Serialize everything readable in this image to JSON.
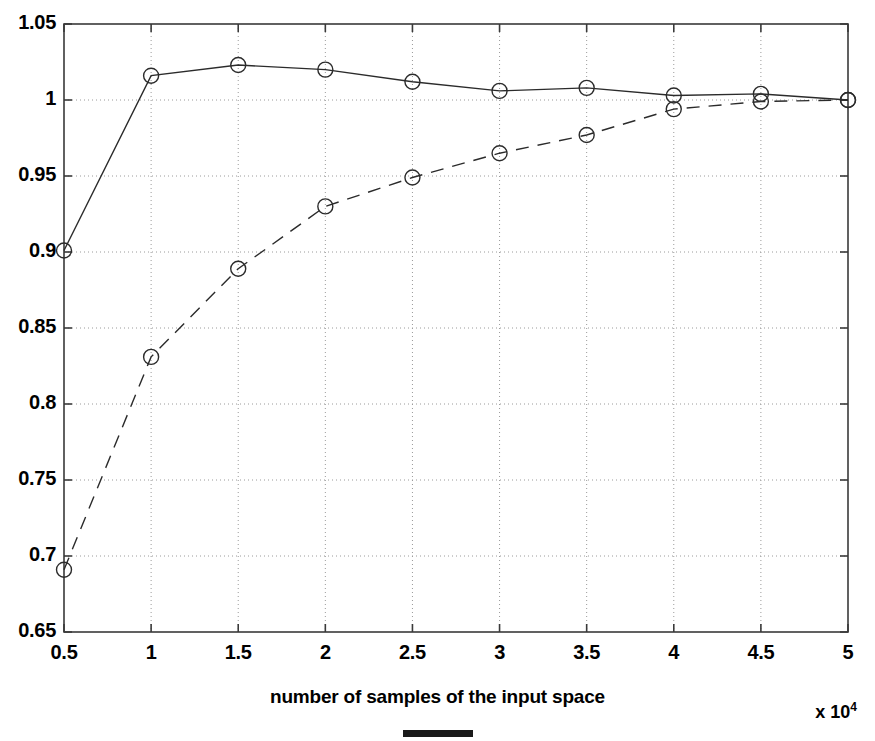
{
  "chart_data": {
    "type": "line",
    "title": "",
    "xlabel": "number of samples of the input space",
    "ylabel": "",
    "x_multiplier": "x 10",
    "x_multiplier_exp": "4",
    "xlim": [
      0.5,
      5
    ],
    "ylim": [
      0.65,
      1.05
    ],
    "grid": true,
    "legend": "none",
    "xticks": [
      "0.5",
      "1",
      "1.5",
      "2",
      "2.5",
      "3",
      "3.5",
      "4",
      "4.5",
      "5"
    ],
    "xtick_values": [
      0.5,
      1,
      1.5,
      2,
      2.5,
      3,
      3.5,
      4,
      4.5,
      5
    ],
    "yticks": [
      "0.65",
      "0.7",
      "0.75",
      "0.8",
      "0.85",
      "0.9",
      "0.95",
      "1",
      "1.05"
    ],
    "ytick_values": [
      0.65,
      0.7,
      0.75,
      0.8,
      0.85,
      0.9,
      0.95,
      1.0,
      1.05
    ],
    "x": [
      0.5,
      1,
      1.5,
      2,
      2.5,
      3,
      3.5,
      4,
      4.5,
      5
    ],
    "series": [
      {
        "name": "solid-series",
        "style": "solid",
        "marker": "circle",
        "color": "#2b2b2b",
        "values": [
          0.901,
          1.016,
          1.023,
          1.02,
          1.012,
          1.006,
          1.008,
          1.003,
          1.004,
          1.0
        ]
      },
      {
        "name": "dashed-series",
        "style": "dashed",
        "marker": "circle",
        "color": "#2b2b2b",
        "values": [
          0.691,
          0.831,
          0.889,
          0.93,
          0.949,
          0.965,
          0.977,
          0.994,
          0.999,
          1.0
        ]
      }
    ]
  },
  "figure": {
    "background": "#ffffff",
    "axis_color": "#3a3a3a",
    "grid_color": "#9a9a9a"
  }
}
